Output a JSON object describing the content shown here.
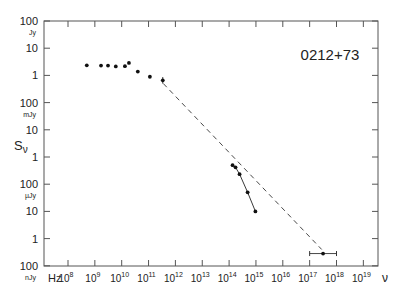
{
  "chart_data": {
    "type": "scatter",
    "title": "0212+73",
    "xlabel": "ν",
    "xunit": "Hz",
    "ylabel": "Sν",
    "xscale": "log",
    "yscale": "log",
    "xlim_log10_hz": [
      7.1,
      19.5
    ],
    "ylim_log10_jy": [
      -7,
      2
    ],
    "grid": false,
    "legend": null,
    "x_ticks": [
      {
        "exp": "8",
        "log": 8
      },
      {
        "exp": "9",
        "log": 9
      },
      {
        "exp": "10",
        "log": 10
      },
      {
        "exp": "11",
        "log": 11
      },
      {
        "exp": "12",
        "log": 12
      },
      {
        "exp": "13",
        "log": 13
      },
      {
        "exp": "14",
        "log": 14
      },
      {
        "exp": "15",
        "log": 15
      },
      {
        "exp": "16",
        "log": 16
      },
      {
        "exp": "17",
        "log": 17
      },
      {
        "exp": "18",
        "log": 18
      },
      {
        "exp": "19",
        "log": 19
      }
    ],
    "y_ticks": [
      {
        "label": "100",
        "unit": "Jy",
        "log": 2
      },
      {
        "label": "10",
        "unit": "",
        "log": 1
      },
      {
        "label": "1",
        "unit": "",
        "log": 0
      },
      {
        "label": "100",
        "unit": "mJy",
        "log": -1
      },
      {
        "label": "10",
        "unit": "",
        "log": -2
      },
      {
        "label": "1",
        "unit": "",
        "log": -3
      },
      {
        "label": "100",
        "unit": "µJy",
        "log": -4
      },
      {
        "label": "10",
        "unit": "",
        "log": -5
      },
      {
        "label": "1",
        "unit": "",
        "log": -6
      },
      {
        "label": "100",
        "unit": "nJy",
        "log": -7
      }
    ],
    "series": [
      {
        "name": "radio",
        "style": "points",
        "points": [
          {
            "log_nu": 8.7,
            "log_s": 0.37
          },
          {
            "log_nu": 9.23,
            "log_s": 0.36
          },
          {
            "log_nu": 9.49,
            "log_s": 0.36
          },
          {
            "log_nu": 9.78,
            "log_s": 0.33
          },
          {
            "log_nu": 10.12,
            "log_s": 0.34
          },
          {
            "log_nu": 10.27,
            "log_s": 0.46
          },
          {
            "log_nu": 10.6,
            "log_s": 0.14
          },
          {
            "log_nu": 11.05,
            "log_s": -0.05
          },
          {
            "log_nu": 11.53,
            "log_s": -0.18,
            "yerr": 0.12
          }
        ]
      },
      {
        "name": "optical-ir",
        "style": "points-connected",
        "points": [
          {
            "log_nu": 14.13,
            "log_s": -3.3
          },
          {
            "log_nu": 14.24,
            "log_s": -3.38
          },
          {
            "log_nu": 14.39,
            "log_s": -3.63
          },
          {
            "log_nu": 14.69,
            "log_s": -4.3
          },
          {
            "log_nu": 14.98,
            "log_s": -5.0
          }
        ]
      },
      {
        "name": "x-ray",
        "style": "point-with-xerr",
        "points": [
          {
            "log_nu": 17.5,
            "log_s": -6.55,
            "xerr_low": 17.0,
            "xerr_high": 18.0
          }
        ]
      },
      {
        "name": "power-law-fit",
        "style": "dashed-line",
        "points": [
          {
            "log_nu": 11.55,
            "log_s": -0.3
          },
          {
            "log_nu": 17.45,
            "log_s": -6.4
          }
        ]
      }
    ]
  },
  "labels": {
    "source_name": "0212+73",
    "y_axis_symbol": "S",
    "y_axis_sub": "ν",
    "x_axis_symbol": "ν",
    "x_unit": "Hz",
    "x_tick_base": "10"
  }
}
